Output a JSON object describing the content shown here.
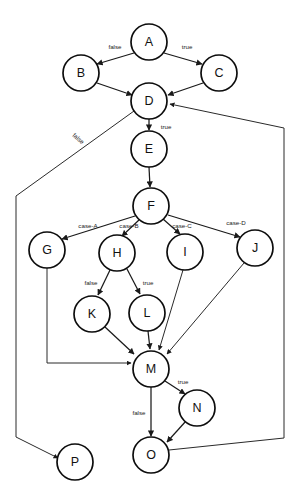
{
  "diagram": {
    "type": "flowchart-directed-graph",
    "background_color": "#ffffff",
    "node_fill": "#ffffff",
    "node_stroke": "#0d0d0d",
    "edge_color": "#1a1a1a",
    "nodes": [
      {
        "id": "A",
        "label": "A",
        "cx": 149,
        "cy": 42,
        "r": 18
      },
      {
        "id": "B",
        "label": "B",
        "cx": 81,
        "cy": 73,
        "r": 18
      },
      {
        "id": "C",
        "label": "C",
        "cx": 219,
        "cy": 73,
        "r": 18
      },
      {
        "id": "D",
        "label": "D",
        "cx": 149,
        "cy": 101,
        "r": 18
      },
      {
        "id": "E",
        "label": "E",
        "cx": 149,
        "cy": 149,
        "r": 18
      },
      {
        "id": "F",
        "label": "F",
        "cx": 151,
        "cy": 206,
        "r": 18
      },
      {
        "id": "G",
        "label": "G",
        "cx": 47,
        "cy": 250,
        "r": 18
      },
      {
        "id": "H",
        "label": "H",
        "cx": 117,
        "cy": 253,
        "r": 18
      },
      {
        "id": "I",
        "label": "I",
        "cx": 185,
        "cy": 252,
        "r": 18
      },
      {
        "id": "J",
        "label": "J",
        "cx": 255,
        "cy": 248,
        "r": 18
      },
      {
        "id": "K",
        "label": "K",
        "cx": 92,
        "cy": 314,
        "r": 18
      },
      {
        "id": "L",
        "label": "L",
        "cx": 147,
        "cy": 313,
        "r": 18
      },
      {
        "id": "M",
        "label": "M",
        "cx": 151,
        "cy": 369,
        "r": 18
      },
      {
        "id": "N",
        "label": "N",
        "cx": 197,
        "cy": 408,
        "r": 18
      },
      {
        "id": "O",
        "label": "O",
        "cx": 151,
        "cy": 455,
        "r": 18
      },
      {
        "id": "P",
        "label": "P",
        "cx": 75,
        "cy": 462,
        "r": 18
      }
    ],
    "edges": [
      {
        "from": "A",
        "to": "B",
        "label": "false",
        "label_x": 115,
        "label_y": 47,
        "rotate": 0
      },
      {
        "from": "A",
        "to": "C",
        "label": "true",
        "label_x": 187,
        "label_y": 47,
        "rotate": 0
      },
      {
        "from": "B",
        "to": "D",
        "label": "",
        "label_x": 0,
        "label_y": 0,
        "rotate": 0
      },
      {
        "from": "C",
        "to": "D",
        "label": "",
        "label_x": 0,
        "label_y": 0,
        "rotate": 0
      },
      {
        "from": "D",
        "to": "E",
        "label": "true",
        "label_x": 166,
        "label_y": 127,
        "rotate": 0
      },
      {
        "from": "D",
        "to": "P",
        "label": "false",
        "label_x": 78,
        "label_y": 139,
        "rotate": 41
      },
      {
        "from": "E",
        "to": "F",
        "label": "",
        "label_x": 0,
        "label_y": 0,
        "rotate": 0
      },
      {
        "from": "F",
        "to": "G",
        "label": "case-A",
        "label_x": 88,
        "label_y": 226,
        "rotate": 0
      },
      {
        "from": "F",
        "to": "H",
        "label": "case-B",
        "label_x": 129,
        "label_y": 226,
        "rotate": 0
      },
      {
        "from": "F",
        "to": "I",
        "label": "case-C",
        "label_x": 182,
        "label_y": 226,
        "rotate": 0
      },
      {
        "from": "F",
        "to": "J",
        "label": "case-D",
        "label_x": 236,
        "label_y": 223,
        "rotate": 0
      },
      {
        "from": "G",
        "to": "M",
        "label": "",
        "label_x": 0,
        "label_y": 0,
        "rotate": 0
      },
      {
        "from": "H",
        "to": "K",
        "label": "false",
        "label_x": 91,
        "label_y": 283,
        "rotate": 0
      },
      {
        "from": "H",
        "to": "L",
        "label": "true",
        "label_x": 148,
        "label_y": 283,
        "rotate": 0
      },
      {
        "from": "I",
        "to": "M",
        "label": "",
        "label_x": 0,
        "label_y": 0,
        "rotate": 0
      },
      {
        "from": "J",
        "to": "M",
        "label": "",
        "label_x": 0,
        "label_y": 0,
        "rotate": 0
      },
      {
        "from": "K",
        "to": "M",
        "label": "",
        "label_x": 0,
        "label_y": 0,
        "rotate": 0
      },
      {
        "from": "L",
        "to": "M",
        "label": "",
        "label_x": 0,
        "label_y": 0,
        "rotate": 0
      },
      {
        "from": "M",
        "to": "N",
        "label": "true",
        "label_x": 183,
        "label_y": 382,
        "rotate": 0
      },
      {
        "from": "M",
        "to": "O",
        "label": "false",
        "label_x": 139,
        "label_y": 413,
        "rotate": 0
      },
      {
        "from": "N",
        "to": "O",
        "label": "",
        "label_x": 0,
        "label_y": 0,
        "rotate": 0
      },
      {
        "from": "O",
        "to": "D",
        "label": "",
        "label_x": 0,
        "label_y": 0,
        "rotate": 0
      }
    ]
  }
}
